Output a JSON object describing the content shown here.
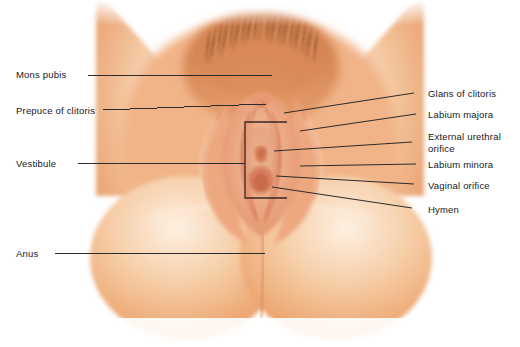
{
  "figure": {
    "view": "anterior-inferior lithotomy view",
    "background_color": "#ffffff",
    "label_text_color": "#17171a",
    "leader_line_color": "#2b2b2b",
    "palette": {
      "skin_light": "#f7ddc6",
      "skin_mid": "#f0b183",
      "skin_deep": "#e08c57",
      "skin_shadow": "#cf7b4d",
      "mucosa_pink": "#e79a7e",
      "mucosa_deep": "#d87a60",
      "hair_dark": "#b9724a",
      "highlight": "#fdf3ea"
    }
  },
  "labels_left": [
    {
      "id": "mons-pubis",
      "text": "Mons pubis",
      "x": 16,
      "y": 69,
      "line": {
        "x1": 88,
        "y1": 75,
        "x2": 272,
        "y2": 75
      }
    },
    {
      "id": "prepuce-of-clitoris",
      "text": "Prepuce of clitoris",
      "x": 16,
      "y": 105,
      "line": {
        "x1": 103,
        "y1": 110,
        "x2": 266,
        "y2": 104
      }
    },
    {
      "id": "vestibule",
      "text": "Vestibule",
      "x": 16,
      "y": 158,
      "line": {
        "x1": 78,
        "y1": 163,
        "x2": 245,
        "y2": 163
      }
    },
    {
      "id": "anus",
      "text": "Anus",
      "x": 16,
      "y": 248,
      "line": {
        "x1": 55,
        "y1": 253,
        "x2": 265,
        "y2": 253
      }
    }
  ],
  "labels_right": [
    {
      "id": "glans-of-clitoris",
      "text": "Glans of clitoris",
      "x": 428,
      "y": 88,
      "lines": [
        "Glans of clitoris"
      ],
      "line": {
        "x1": 414,
        "y1": 93,
        "x2": 284,
        "y2": 113
      }
    },
    {
      "id": "labium-majora",
      "text": "Labium majora",
      "x": 428,
      "y": 109,
      "lines": [
        "Labium majora"
      ],
      "line": {
        "x1": 416,
        "y1": 114,
        "x2": 300,
        "y2": 131
      }
    },
    {
      "id": "external-urethral-orifice",
      "text": "External urethral orifice",
      "x": 428,
      "y": 131,
      "lines": [
        "External urethral",
        "orifice"
      ],
      "line": {
        "x1": 412,
        "y1": 142,
        "x2": 274,
        "y2": 151
      }
    },
    {
      "id": "labium-minora",
      "text": "Labium minora",
      "x": 428,
      "y": 159,
      "lines": [
        "Labium minora"
      ],
      "line": {
        "x1": 416,
        "y1": 164,
        "x2": 300,
        "y2": 166
      }
    },
    {
      "id": "vaginal-orifice",
      "text": "Vaginal orifice",
      "x": 428,
      "y": 180,
      "lines": [
        "Vaginal orifice"
      ],
      "line": {
        "x1": 414,
        "y1": 184,
        "x2": 276,
        "y2": 176
      }
    },
    {
      "id": "hymen",
      "text": "Hymen",
      "x": 428,
      "y": 204,
      "lines": [
        "Hymen"
      ],
      "line": {
        "x1": 412,
        "y1": 208,
        "x2": 272,
        "y2": 187
      }
    }
  ],
  "vestibule_bracket": {
    "id": "vestibule-bracket",
    "description": "open rectangular bracket outlining the vestibule region",
    "color": "#3a2a22",
    "x": 245,
    "y": 122,
    "width": 42,
    "height": 76
  },
  "structures": [
    {
      "id": "mons-pubis-region",
      "name": "mons pubis with pubic hair"
    },
    {
      "id": "left-thigh",
      "name": "left thigh"
    },
    {
      "id": "right-thigh",
      "name": "right thigh"
    },
    {
      "id": "labium-majora-left",
      "name": "left labium majora"
    },
    {
      "id": "labium-majora-right",
      "name": "right labium majora"
    },
    {
      "id": "labium-minora-left",
      "name": "left labium minora"
    },
    {
      "id": "labium-minora-right",
      "name": "right labium minora"
    },
    {
      "id": "glans-clitoris",
      "name": "glans of clitoris"
    },
    {
      "id": "prepuce",
      "name": "prepuce of clitoris"
    },
    {
      "id": "urethral-orifice",
      "name": "external urethral orifice"
    },
    {
      "id": "vaginal-orifice-structure",
      "name": "vaginal orifice"
    },
    {
      "id": "hymen-structure",
      "name": "hymen"
    },
    {
      "id": "perineum",
      "name": "perineum"
    },
    {
      "id": "buttock-left",
      "name": "left buttock"
    },
    {
      "id": "buttock-right",
      "name": "right buttock"
    },
    {
      "id": "anus-structure",
      "name": "anus / natal cleft"
    }
  ]
}
